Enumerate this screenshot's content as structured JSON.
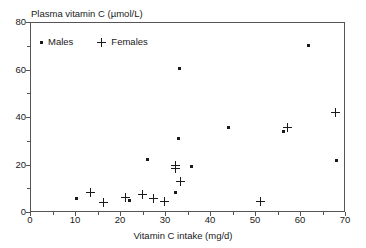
{
  "chart_data": {
    "type": "scatter",
    "title": "Plasma vitamin C (µmol/L)",
    "xlabel": "Vitamin C intake (mg/d)",
    "ylabel": "",
    "xlim": [
      0,
      70
    ],
    "ylim": [
      0,
      80
    ],
    "xticks": [
      0,
      10,
      20,
      30,
      40,
      50,
      60,
      70
    ],
    "xtick_labels": [
      "0",
      "10",
      "20",
      "30",
      "40",
      "50",
      "60",
      "70"
    ],
    "xminor_ticks": [
      5,
      15,
      25,
      35,
      45,
      55,
      65
    ],
    "yticks": [
      0,
      20,
      40,
      60,
      80
    ],
    "ytick_labels": [
      "0",
      "20",
      "40",
      "60",
      "80"
    ],
    "yminor_ticks": [
      10,
      30,
      50,
      70
    ],
    "grid": false,
    "legend_position": "upper-left-inside",
    "marker_color": "#1a1a1a",
    "series": [
      {
        "name": "Males",
        "marker": "dot",
        "points": [
          [
            10.0,
            5.9
          ],
          [
            21.8,
            5.3
          ],
          [
            25.9,
            22.6
          ],
          [
            32.0,
            8.6
          ],
          [
            32.8,
            31.3
          ],
          [
            33.1,
            60.9
          ],
          [
            35.6,
            19.6
          ],
          [
            43.8,
            36.2
          ],
          [
            56.1,
            34.5
          ],
          [
            61.6,
            70.5
          ],
          [
            67.8,
            22.3
          ]
        ]
      },
      {
        "name": "Females",
        "marker": "plus",
        "points": [
          [
            13.2,
            8.7
          ],
          [
            16.1,
            4.3
          ],
          [
            21.0,
            6.6
          ],
          [
            24.7,
            7.9
          ],
          [
            27.3,
            6.3
          ],
          [
            29.6,
            5.0
          ],
          [
            32.2,
            20.0
          ],
          [
            32.2,
            18.6
          ],
          [
            33.2,
            13.3
          ],
          [
            51.0,
            5.0
          ],
          [
            56.9,
            36.1
          ],
          [
            67.7,
            42.3
          ]
        ]
      }
    ]
  },
  "legend": {
    "males_label": "Males",
    "females_label": "Females"
  }
}
